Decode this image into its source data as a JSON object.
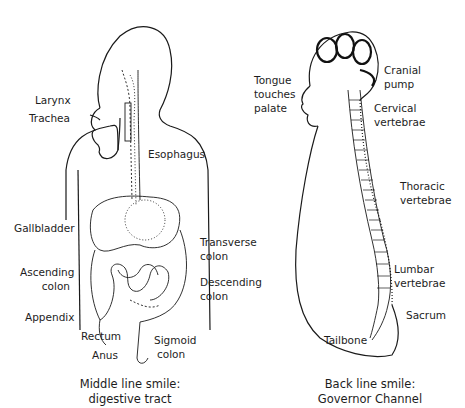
{
  "figures": [
    {
      "id": "middle-line",
      "caption_line1": "Middle line smile:",
      "caption_line2": "digestive tract",
      "labels": {
        "larynx": "Larynx",
        "trachea": "Trachea",
        "esophagus": "Esophagus",
        "gallbladder": "Gallbladder",
        "transverse_1": "Transverse",
        "transverse_2": "colon",
        "ascending_1": "Ascending",
        "ascending_2": "colon",
        "descending_1": "Descending",
        "descending_2": "colon",
        "appendix": "Appendix",
        "rectum": "Rectum",
        "anus": "Anus",
        "sigmoid_1": "Sigmoid",
        "sigmoid_2": "colon"
      }
    },
    {
      "id": "back-line",
      "caption_line1": "Back line smile:",
      "caption_line2": "Governor Channel",
      "labels": {
        "tongue_1": "Tongue",
        "tongue_2": "touches",
        "tongue_3": "palate",
        "cranial_1": "Cranial",
        "cranial_2": "pump",
        "cervical_1": "Cervical",
        "cervical_2": "vertebrae",
        "thoracic_1": "Thoracic",
        "thoracic_2": "vertebrae",
        "lumbar_1": "Lumbar",
        "lumbar_2": "vertebrae",
        "sacrum": "Sacrum",
        "tailbone": "Tailbone"
      }
    }
  ]
}
